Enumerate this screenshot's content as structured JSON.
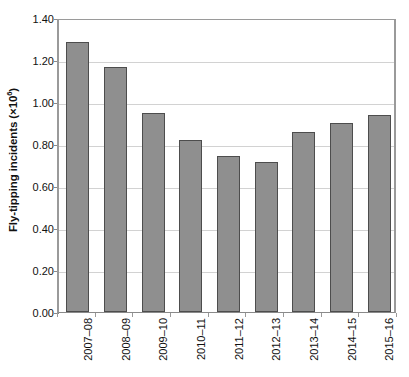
{
  "chart_data": {
    "type": "bar",
    "title": "",
    "xlabel": "",
    "ylabel": "Fly-tipping incidents (×10⁶)",
    "ylabel_prefix": "Fly-tipping incidents (×10",
    "ylabel_superscript": "6",
    "ylabel_suffix": ")",
    "categories": [
      "2007–08",
      "2008–09",
      "2009–10",
      "2010–11",
      "2011–12",
      "2012–13",
      "2013–14",
      "2014–15",
      "2015–16"
    ],
    "values": [
      1.285,
      1.165,
      0.95,
      0.82,
      0.745,
      0.715,
      0.855,
      0.9,
      0.94
    ],
    "ylim": [
      0.0,
      1.4
    ],
    "ytick_values": [
      0.0,
      0.2,
      0.4,
      0.6,
      0.8,
      1.0,
      1.2,
      1.4
    ],
    "ytick_labels": [
      "0.00",
      "0.20",
      "0.40",
      "0.60",
      "0.80",
      "1.00",
      "1.20",
      "1.40"
    ],
    "grid": true,
    "legend": false,
    "legend_position": "none",
    "bar_color": "#8f8f8f",
    "bar_border_color": "#4d4d4d",
    "gridline_color": "#d2d2d2",
    "axis_color": "#9a9a9a",
    "background_color": "#ffffff",
    "text_color": "#111111"
  }
}
